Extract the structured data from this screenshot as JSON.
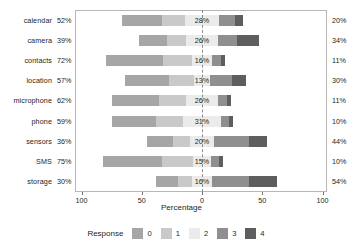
{
  "chart_data": {
    "type": "bar",
    "subtype": "diverging-stacked-likert",
    "title": "",
    "xlabel": "Percentage",
    "ylabel": "",
    "xlim": [
      -100,
      100
    ],
    "xticks": [
      100,
      50,
      0,
      50,
      100
    ],
    "xtick_labels": [
      "100",
      "50",
      "0",
      "50",
      "100"
    ],
    "grid": false,
    "zero_reference_line": true,
    "legend": {
      "title": "Response",
      "position": "bottom",
      "entries": [
        {
          "label": "0",
          "color": "#a6a6a6"
        },
        {
          "label": "1",
          "color": "#c9c9c9"
        },
        {
          "label": "2",
          "color": "#ebebeb"
        },
        {
          "label": "3",
          "color": "#8f8f8f"
        },
        {
          "label": "4",
          "color": "#5e5e5e"
        }
      ]
    },
    "categories": [
      "calendar",
      "camera",
      "contacts",
      "location",
      "microphone",
      "phone",
      "sensors",
      "SMS",
      "storage"
    ],
    "series": [
      {
        "name": "0",
        "color": "#a6a6a6",
        "values": [
          33,
          23,
          48,
          36,
          39,
          36,
          22,
          49,
          18
        ]
      },
      {
        "name": "1",
        "color": "#c9c9c9",
        "values": [
          19,
          16,
          24,
          21,
          23,
          23,
          14,
          26,
          12
        ]
      },
      {
        "name": "2",
        "color": "#ebebeb",
        "values": [
          28,
          26,
          16,
          13,
          26,
          31,
          20,
          15,
          16
        ]
      },
      {
        "name": "3",
        "color": "#8f8f8f",
        "values": [
          13,
          16,
          8,
          18,
          8,
          7,
          29,
          7,
          31
        ]
      },
      {
        "name": "4",
        "color": "#5e5e5e",
        "values": [
          7,
          18,
          3,
          12,
          3,
          3,
          15,
          3,
          23
        ]
      }
    ],
    "rows": [
      {
        "category": "calendar",
        "left_pct": "52%",
        "center_pct": "28%",
        "right_pct": "20%",
        "left_value": 52,
        "center_value": 28,
        "right_value": 20
      },
      {
        "category": "camera",
        "left_pct": "39%",
        "center_pct": "26%",
        "right_pct": "34%",
        "left_value": 39,
        "center_value": 26,
        "right_value": 34
      },
      {
        "category": "contacts",
        "left_pct": "72%",
        "center_pct": "16%",
        "right_pct": "11%",
        "left_value": 72,
        "center_value": 16,
        "right_value": 11
      },
      {
        "category": "location",
        "left_pct": "57%",
        "center_pct": "13%",
        "right_pct": "30%",
        "left_value": 57,
        "center_value": 13,
        "right_value": 30
      },
      {
        "category": "microphone",
        "left_pct": "62%",
        "center_pct": "26%",
        "right_pct": "11%",
        "left_value": 62,
        "center_value": 26,
        "right_value": 11
      },
      {
        "category": "phone",
        "left_pct": "59%",
        "center_pct": "31%",
        "right_pct": "10%",
        "left_value": 59,
        "center_value": 31,
        "right_value": 10
      },
      {
        "category": "sensors",
        "left_pct": "36%",
        "center_pct": "20%",
        "right_pct": "44%",
        "left_value": 36,
        "center_value": 20,
        "right_value": 44
      },
      {
        "category": "SMS",
        "left_pct": "75%",
        "center_pct": "15%",
        "right_pct": "10%",
        "left_value": 75,
        "center_value": 15,
        "right_value": 10
      },
      {
        "category": "storage",
        "left_pct": "30%",
        "center_pct": "16%",
        "right_pct": "54%",
        "left_value": 30,
        "center_value": 16,
        "right_value": 54
      }
    ]
  }
}
